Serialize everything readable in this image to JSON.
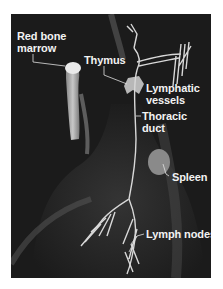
{
  "figure": {
    "background_color": "#1b1b1b",
    "label_color": "#f2f2f2",
    "labels": [
      {
        "id": "red-bone-marrow",
        "line1": "Red bone",
        "line2": "marrow"
      },
      {
        "id": "thymus",
        "line1": "Thymus"
      },
      {
        "id": "lymphatic-vessels",
        "line1": "Lymphatic",
        "line2": "vessels"
      },
      {
        "id": "thoracic-duct",
        "line1": "Thoracic",
        "line2": "duct"
      },
      {
        "id": "spleen",
        "line1": "Spleen"
      },
      {
        "id": "lymph-nodes",
        "line1": "Lymph nodes"
      }
    ]
  }
}
